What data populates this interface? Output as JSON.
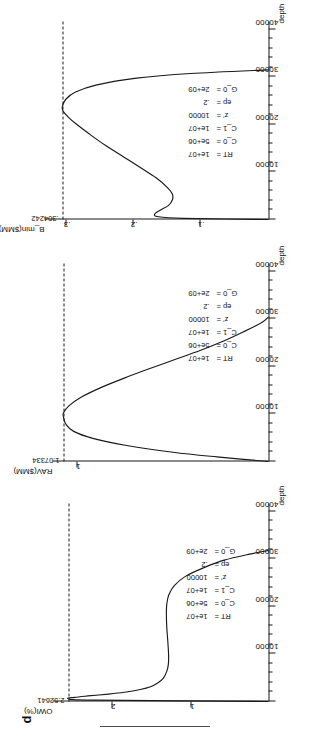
{
  "figure": {
    "panel_letter": "d",
    "xaxis_title": "depth",
    "xtick_labels": [
      "10000",
      "20000",
      "30000",
      "40000"
    ]
  },
  "panels": [
    {
      "id": "owi",
      "ylabel": "OWI(%)",
      "peak_value": "2.52641",
      "ytick_labels": [
        "1",
        "2"
      ],
      "params": [
        {
          "name": "RT =",
          "value": "1e+07"
        },
        {
          "name": "C_0 =",
          "value": "5e+06"
        },
        {
          "name": "C_1 =",
          "value": "1e+07"
        },
        {
          "name": "z' =",
          "value": "10000"
        },
        {
          "name": "ep =",
          "value": ".2"
        },
        {
          "name": "G_0 =",
          "value": "2e+09"
        }
      ]
    },
    {
      "id": "rav",
      "ylabel": "RAV($MM)",
      "peak_value": "1.07334",
      "ytick_labels": [
        "1"
      ],
      "params": [
        {
          "name": "RT =",
          "value": "1e+07"
        },
        {
          "name": "C_0 =",
          "value": "5e+06"
        },
        {
          "name": "C_1 =",
          "value": "1e+07"
        },
        {
          "name": "z' =",
          "value": "10000"
        },
        {
          "name": "ep =",
          "value": ".2"
        },
        {
          "name": "G_0 =",
          "value": "2e+09"
        }
      ]
    },
    {
      "id": "bmin",
      "ylabel": "B_min($MM)",
      "peak_value": ".304242",
      "ytick_labels": [
        ".1",
        ".2",
        ".3"
      ],
      "params": [
        {
          "name": "RT =",
          "value": "1e+07"
        },
        {
          "name": "C_0 =",
          "value": "5e+06"
        },
        {
          "name": "C_1 =",
          "value": "1e+07"
        },
        {
          "name": "z' =",
          "value": "10000"
        },
        {
          "name": "ep =",
          "value": ".2"
        },
        {
          "name": "G_0 =",
          "value": "2e+09"
        }
      ]
    }
  ],
  "chart_data": [
    {
      "type": "line",
      "id": "owi",
      "title": "OWI(%) vs depth",
      "xlabel": "depth",
      "ylabel": "OWI(%)",
      "xlim": [
        0,
        41000
      ],
      "ylim": [
        0,
        2.75
      ],
      "xticks": [
        10000,
        20000,
        30000,
        40000
      ],
      "yticks": [
        1,
        2
      ],
      "grid": false,
      "peak_value": 2.52641,
      "peak_reference_line": 2.52641,
      "x": [
        0,
        300,
        600,
        900,
        1200,
        1600,
        2000,
        2600,
        3200,
        4000,
        5000,
        6500,
        8000,
        10000,
        13000,
        16000,
        19000,
        21000,
        23000,
        25000,
        27000,
        29000,
        30500,
        31800,
        32600
      ],
      "y": [
        0,
        2.2,
        2.52641,
        2.45,
        2.28,
        2.02,
        1.82,
        1.62,
        1.49,
        1.4,
        1.33,
        1.285,
        1.265,
        1.262,
        1.272,
        1.285,
        1.29,
        1.285,
        1.26,
        1.19,
        1.05,
        0.8,
        0.56,
        0.24,
        0.0
      ]
    },
    {
      "type": "line",
      "id": "rav",
      "title": "RAV($MM) vs depth",
      "xlabel": "depth",
      "ylabel": "RAV($MM)",
      "xlim": [
        0,
        41000
      ],
      "ylim": [
        0,
        1.18
      ],
      "xticks": [
        10000,
        20000,
        30000,
        40000
      ],
      "yticks": [
        1
      ],
      "grid": false,
      "peak_value": 1.07334,
      "peak_reference_line": 1.07334,
      "x": [
        0,
        1000,
        2000,
        3500,
        5000,
        6500,
        8000,
        9500,
        10500,
        12000,
        14000,
        16000,
        18000,
        20000,
        22000,
        24000,
        26000,
        28000,
        30000,
        31200
      ],
      "y": [
        0,
        0.27,
        0.5,
        0.75,
        0.92,
        1.02,
        1.06,
        1.073,
        1.07334,
        1.045,
        0.975,
        0.875,
        0.755,
        0.625,
        0.49,
        0.355,
        0.235,
        0.13,
        0.035,
        0.0
      ]
    },
    {
      "type": "line",
      "id": "bmin",
      "title": "B_min($MM) vs depth",
      "xlabel": "depth",
      "ylabel": "B_min($MM)",
      "xlim": [
        0,
        41000
      ],
      "ylim": [
        0,
        0.335
      ],
      "xticks": [
        10000,
        20000,
        30000,
        40000
      ],
      "yticks": [
        0.1,
        0.2,
        0.3
      ],
      "grid": false,
      "peak_value": 0.304242,
      "peak_reference_line": 0.304242,
      "x": [
        0,
        250,
        600,
        1200,
        2000,
        3000,
        4200,
        5500,
        7000,
        9000,
        11000,
        13500,
        16000,
        18500,
        20500,
        22000,
        23400,
        24500,
        26000,
        27500,
        29000,
        30500,
        31500,
        32300
      ],
      "y": [
        0,
        0.125,
        0.163,
        0.168,
        0.16,
        0.148,
        0.142,
        0.142,
        0.15,
        0.166,
        0.187,
        0.214,
        0.241,
        0.265,
        0.283,
        0.295,
        0.3035,
        0.30424,
        0.299,
        0.285,
        0.255,
        0.195,
        0.115,
        0.0
      ]
    }
  ]
}
